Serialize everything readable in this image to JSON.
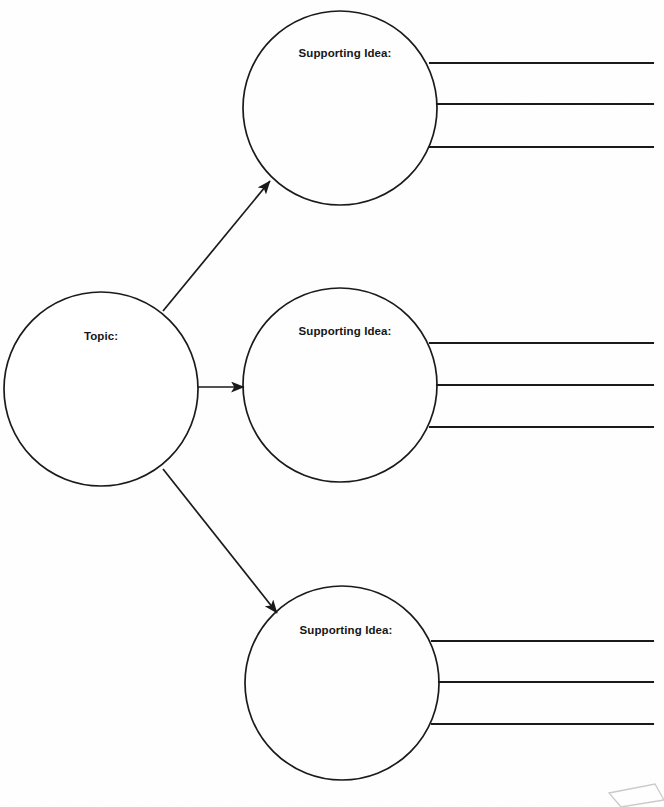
{
  "document": {
    "title": "Main Idea and Supporting Details Graphic Organizer",
    "background_color": "#fefefe",
    "ink_color": "#1a1a1a",
    "width": 664,
    "height": 807
  },
  "topic_node": {
    "label": "Topic:",
    "cx": 101,
    "cy": 389,
    "r": 97,
    "label_x": 101,
    "label_y": 336
  },
  "supporting_nodes": [
    {
      "id": "supporting-idea-1",
      "label": "Supporting Idea:",
      "cx": 340,
      "cy": 108,
      "r": 97,
      "label_x": 345,
      "label_y": 53,
      "lines": [
        {
          "y": 63,
          "x1": 430,
          "x2": 653
        },
        {
          "y": 104,
          "x1": 437,
          "x2": 653
        },
        {
          "y": 147,
          "x1": 430,
          "x2": 653
        }
      ]
    },
    {
      "id": "supporting-idea-2",
      "label": "Supporting Idea:",
      "cx": 340,
      "cy": 385,
      "r": 97,
      "label_x": 345,
      "label_y": 331,
      "lines": [
        {
          "y": 343,
          "x1": 430,
          "x2": 653
        },
        {
          "y": 385,
          "x1": 437,
          "x2": 653
        },
        {
          "y": 427,
          "x1": 430,
          "x2": 653
        }
      ]
    },
    {
      "id": "supporting-idea-3",
      "label": "Supporting Idea:",
      "cx": 342,
      "cy": 683,
      "r": 97,
      "label_x": 346,
      "label_y": 630,
      "lines": [
        {
          "y": 641,
          "x1": 432,
          "x2": 653
        },
        {
          "y": 682,
          "x1": 439,
          "x2": 653
        },
        {
          "y": 724,
          "x1": 432,
          "x2": 653
        }
      ]
    }
  ],
  "connectors": [
    {
      "id": "connector-to-supporting-1",
      "x1": 163,
      "y1": 311,
      "x2": 270,
      "y2": 181
    },
    {
      "id": "connector-to-supporting-2",
      "x1": 197,
      "y1": 387,
      "x2": 244,
      "y2": 387
    },
    {
      "id": "connector-to-supporting-3",
      "x1": 163,
      "y1": 469,
      "x2": 277,
      "y2": 613
    }
  ],
  "corner_artifact": {
    "id": "page-corner-artifact",
    "points": "609,793 655,784 664,800 621,807",
    "color": "#b8b8b8"
  }
}
